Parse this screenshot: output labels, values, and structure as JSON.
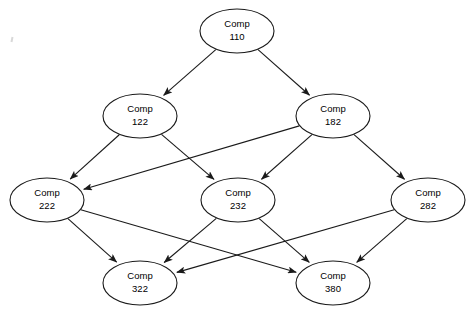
{
  "diagram": {
    "background_color": "#ffffff",
    "stroke_color": "#1a1a1a",
    "node_fill_color": "#ffffff",
    "node_shape": "ellipse",
    "node_rx": 37,
    "node_ry": 22,
    "nodes": [
      {
        "id": "comp110",
        "prefix": "Comp",
        "number": "110",
        "x": 237,
        "y": 31
      },
      {
        "id": "comp122",
        "prefix": "Comp",
        "number": "122",
        "x": 140,
        "y": 116
      },
      {
        "id": "comp182",
        "prefix": "Comp",
        "number": "182",
        "x": 333,
        "y": 116
      },
      {
        "id": "comp222",
        "prefix": "Comp",
        "number": "222",
        "x": 47,
        "y": 200
      },
      {
        "id": "comp232",
        "prefix": "Comp",
        "number": "232",
        "x": 238,
        "y": 200
      },
      {
        "id": "comp282",
        "prefix": "Comp",
        "number": "282",
        "x": 428,
        "y": 200
      },
      {
        "id": "comp322",
        "prefix": "Comp",
        "number": "322",
        "x": 140,
        "y": 283
      },
      {
        "id": "comp380",
        "prefix": "Comp",
        "number": "380",
        "x": 333,
        "y": 283
      }
    ],
    "edges": [
      {
        "id": "e1",
        "from": "comp110",
        "to": "comp122",
        "directed": true
      },
      {
        "id": "e2",
        "from": "comp110",
        "to": "comp182",
        "directed": true
      },
      {
        "id": "e3",
        "from": "comp122",
        "to": "comp222",
        "directed": true
      },
      {
        "id": "e4",
        "from": "comp122",
        "to": "comp232",
        "directed": true
      },
      {
        "id": "e5",
        "from": "comp182",
        "to": "comp222",
        "directed": true
      },
      {
        "id": "e6",
        "from": "comp182",
        "to": "comp232",
        "directed": true
      },
      {
        "id": "e7",
        "from": "comp182",
        "to": "comp282",
        "directed": true
      },
      {
        "id": "e8",
        "from": "comp222",
        "to": "comp322",
        "directed": true
      },
      {
        "id": "e9",
        "from": "comp222",
        "to": "comp380",
        "directed": true
      },
      {
        "id": "e10",
        "from": "comp232",
        "to": "comp322",
        "directed": true
      },
      {
        "id": "e11",
        "from": "comp232",
        "to": "comp380",
        "directed": true
      },
      {
        "id": "e12",
        "from": "comp282",
        "to": "comp322",
        "directed": true
      },
      {
        "id": "e13",
        "from": "comp282",
        "to": "comp380",
        "directed": true
      }
    ]
  }
}
